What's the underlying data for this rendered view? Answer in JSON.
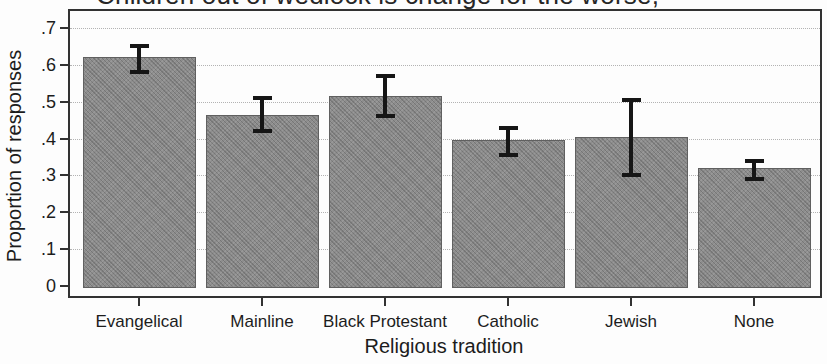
{
  "chart_data": {
    "type": "bar",
    "title": "Children out of wedlock is change for the worse,",
    "title_clipped_at_top": true,
    "xlabel": "Religious tradition",
    "ylabel": "Proportion of responses",
    "categories": [
      "Evangelical",
      "Mainline",
      "Black Protestant",
      "Catholic",
      "Jewish",
      "None"
    ],
    "values": [
      0.62,
      0.465,
      0.515,
      0.395,
      0.405,
      0.32
    ],
    "error_low": [
      0.58,
      0.42,
      0.46,
      0.355,
      0.3,
      0.29
    ],
    "error_high": [
      0.65,
      0.51,
      0.57,
      0.43,
      0.505,
      0.34
    ],
    "ylim": [
      0,
      0.7
    ],
    "yticks": [
      0,
      0.1,
      0.2,
      0.3,
      0.4,
      0.5,
      0.6,
      0.7
    ],
    "ytick_labels": [
      "0",
      ".1",
      ".2",
      ".3",
      ".4",
      ".5",
      ".6",
      ".7"
    ],
    "grid": "horizontal dotted lines at each y tick from .1 to .7",
    "legend": "none",
    "bar_color": "#8d8d8d",
    "bar_border_color": "#606060",
    "error_bar_color": "#161616",
    "frame_color": "#323232",
    "background": "#fdfdfd"
  }
}
